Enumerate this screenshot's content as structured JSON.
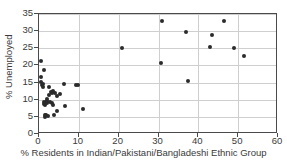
{
  "chart_data": {
    "type": "scatter",
    "title": "",
    "xlabel": "% Residents in Indian/Pakistani/Bangladeshi Ethnic Group",
    "ylabel": "% Unemployed",
    "xlim": [
      0,
      60
    ],
    "ylim": [
      0,
      35
    ],
    "xticks": [
      0,
      10,
      20,
      30,
      40,
      50,
      60
    ],
    "yticks": [
      0,
      5,
      10,
      15,
      20,
      25,
      30,
      35
    ],
    "grid": true,
    "legend": "none",
    "marker_color": "#2b2b2b",
    "axis_color": "#4a4a4a",
    "grid_color": "#cfcfcf",
    "series": [
      {
        "name": "Local authority districts",
        "points": [
          [
            0.4,
            21.2
          ],
          [
            0.5,
            16.6
          ],
          [
            0.6,
            15.1
          ],
          [
            0.7,
            14.2
          ],
          [
            1.0,
            14.6
          ],
          [
            1.1,
            13.7
          ],
          [
            1.2,
            18.6
          ],
          [
            1.2,
            9.4
          ],
          [
            1.3,
            8.8
          ],
          [
            1.4,
            8.4
          ],
          [
            1.5,
            5.4
          ],
          [
            1.6,
            5.1
          ],
          [
            1.7,
            5.6
          ],
          [
            1.8,
            9.2
          ],
          [
            1.9,
            10.2
          ],
          [
            2.0,
            9.6
          ],
          [
            2.1,
            8.9
          ],
          [
            2.2,
            5.2
          ],
          [
            2.4,
            13.8
          ],
          [
            2.6,
            11.4
          ],
          [
            2.8,
            9.3
          ],
          [
            3.0,
            12.2
          ],
          [
            3.2,
            11.9
          ],
          [
            3.3,
            9.0
          ],
          [
            3.5,
            12.4
          ],
          [
            3.6,
            8.6
          ],
          [
            3.8,
            5.6
          ],
          [
            4.1,
            12.0
          ],
          [
            4.4,
            11.0
          ],
          [
            4.6,
            6.6
          ],
          [
            5.2,
            11.8
          ],
          [
            6.3,
            14.7
          ],
          [
            6.5,
            8.3
          ],
          [
            9.3,
            14.3
          ],
          [
            9.7,
            14.3
          ],
          [
            11.0,
            7.4
          ],
          [
            20.9,
            25.2
          ],
          [
            30.6,
            20.8
          ],
          [
            31.0,
            33.1
          ],
          [
            36.8,
            29.7
          ],
          [
            37.4,
            15.4
          ],
          [
            42.9,
            25.3
          ],
          [
            43.5,
            28.9
          ],
          [
            46.4,
            33.0
          ],
          [
            49.0,
            25.1
          ],
          [
            51.5,
            22.8
          ]
        ]
      }
    ]
  }
}
